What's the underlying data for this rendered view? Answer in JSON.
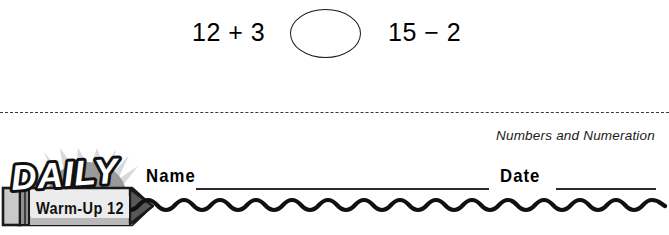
{
  "worksheet": {
    "problem": {
      "left_expression": "12 + 3",
      "right_expression": "15 − 2",
      "answer_oval_value": ""
    },
    "strand_label": "Numbers and Numeration",
    "fields": {
      "name_label": "Name",
      "name_value": "",
      "date_label": "Date",
      "date_value": ""
    },
    "logo": {
      "title": "DAILY",
      "subtitle": "Warm-Up 12",
      "colors": {
        "ray_fill": "#d9d9d9",
        "sun_fill": "#9a9a9a",
        "pencil_body": "#e8e8e8",
        "pencil_shadow": "#b5b5b5",
        "ferrule": "#8f8f8f",
        "eraser": "#c9c9c9",
        "tip": "#555555",
        "outline": "#1a1a1a",
        "title_fill": "#ffffff"
      }
    }
  }
}
